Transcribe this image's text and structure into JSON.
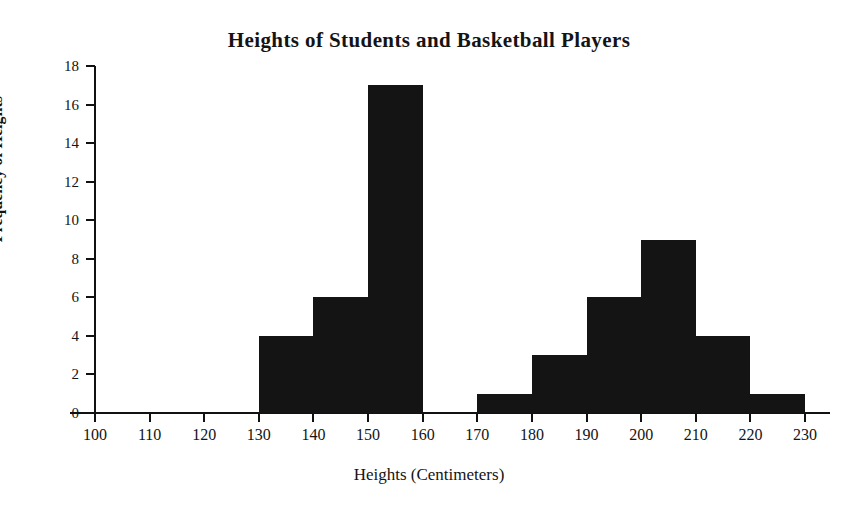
{
  "chart_data": {
    "type": "bar",
    "title": "Heights of Students and Basketball Players",
    "xlabel": "Heights (Centimeters)",
    "ylabel": "Frequency of Heights",
    "grid": false,
    "legend": "none",
    "xlim": [
      100,
      230
    ],
    "ylim": [
      0,
      18
    ],
    "bin_width": 10,
    "x_ticks": [
      100,
      110,
      120,
      130,
      140,
      150,
      160,
      170,
      180,
      190,
      200,
      210,
      220,
      230
    ],
    "x_tick_labels": [
      "100",
      "110",
      "120",
      "130",
      "140",
      "150",
      "160",
      "170",
      "180",
      "190",
      "200",
      "210",
      "220",
      "230"
    ],
    "y_ticks": [
      0,
      2,
      4,
      6,
      8,
      10,
      12,
      14,
      16,
      18
    ],
    "y_tick_labels": [
      "0",
      "2",
      "4",
      "6",
      "8",
      "10",
      "12",
      "14",
      "16",
      "18"
    ],
    "bar_color": "#141414",
    "axis_color": "#111111",
    "bins": [
      {
        "label": "100-110",
        "start": 100,
        "end": 110,
        "value": 0
      },
      {
        "label": "110-120",
        "start": 110,
        "end": 120,
        "value": 0
      },
      {
        "label": "120-130",
        "start": 120,
        "end": 130,
        "value": 0
      },
      {
        "label": "130-140",
        "start": 130,
        "end": 140,
        "value": 4
      },
      {
        "label": "140-150",
        "start": 140,
        "end": 150,
        "value": 6
      },
      {
        "label": "150-160",
        "start": 150,
        "end": 160,
        "value": 17
      },
      {
        "label": "160-170",
        "start": 160,
        "end": 170,
        "value": 0
      },
      {
        "label": "170-180",
        "start": 170,
        "end": 180,
        "value": 1
      },
      {
        "label": "180-190",
        "start": 180,
        "end": 190,
        "value": 3
      },
      {
        "label": "190-200",
        "start": 190,
        "end": 200,
        "value": 6
      },
      {
        "label": "200-210",
        "start": 200,
        "end": 210,
        "value": 9
      },
      {
        "label": "210-220",
        "start": 210,
        "end": 220,
        "value": 4
      },
      {
        "label": "220-230",
        "start": 220,
        "end": 230,
        "value": 1
      }
    ],
    "categories": [
      "100-110",
      "110-120",
      "120-130",
      "130-140",
      "140-150",
      "150-160",
      "160-170",
      "170-180",
      "180-190",
      "190-200",
      "200-210",
      "210-220",
      "220-230"
    ],
    "values": [
      0,
      0,
      0,
      4,
      6,
      17,
      0,
      1,
      3,
      6,
      9,
      4,
      1
    ]
  }
}
